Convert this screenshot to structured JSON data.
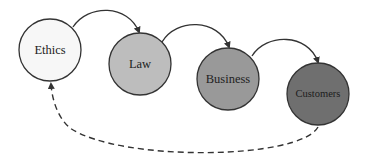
{
  "diagram": {
    "nodes": [
      {
        "id": "ethics",
        "label": "Ethics",
        "fill": "#f7f7f7"
      },
      {
        "id": "law",
        "label": "Law",
        "fill": "#bdbdbd"
      },
      {
        "id": "business",
        "label": "Business",
        "fill": "#999999"
      },
      {
        "id": "customers",
        "label": "Customers",
        "fill": "#6f6f6f"
      }
    ],
    "edges": [
      {
        "from": "ethics",
        "to": "law",
        "style": "solid"
      },
      {
        "from": "law",
        "to": "business",
        "style": "solid"
      },
      {
        "from": "business",
        "to": "customers",
        "style": "solid"
      },
      {
        "from": "customers",
        "to": "ethics",
        "style": "dashed"
      }
    ]
  }
}
